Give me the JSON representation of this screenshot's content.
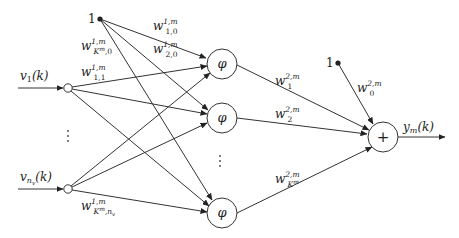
{
  "diagram": {
    "type": "neural-network",
    "inputs": [
      {
        "id": "v1",
        "label": "v",
        "sub": "1",
        "arg": "(k)"
      },
      {
        "id": "vnv",
        "label": "v",
        "sub": "n",
        "subsub": "v",
        "arg": "(k)"
      }
    ],
    "bias_inputs": [
      {
        "id": "bias1",
        "label": "1"
      },
      {
        "id": "bias2",
        "label": "1"
      }
    ],
    "hidden_nodes": [
      {
        "id": "phi1",
        "symbol": "φ"
      },
      {
        "id": "phi2",
        "symbol": "φ"
      },
      {
        "id": "phiK",
        "symbol": "φ"
      }
    ],
    "output_node": {
      "id": "sum",
      "symbol": "+"
    },
    "output_label": {
      "main": "y",
      "sub": "m",
      "arg": "(k)"
    },
    "ellipsis": "⋮",
    "weights": {
      "w1_10": {
        "base": "w",
        "sup": "1,m",
        "sub": "1,0"
      },
      "w1_20": {
        "base": "w",
        "sup": "1,m",
        "sub": "2,0"
      },
      "w1_K0": {
        "base": "w",
        "sup": "1,m",
        "sub_main": "K",
        "sub_sup": "m",
        "sub_tail": ",0"
      },
      "w1_11": {
        "base": "w",
        "sup": "1,m",
        "sub": "1,1"
      },
      "w1_Knv": {
        "base": "w",
        "sup": "1,m",
        "sub_main": "K",
        "sub_sup": "m",
        "sub_tail": ",n",
        "sub_tail_sub": "v"
      },
      "w2_1": {
        "base": "w",
        "sup": "2,m",
        "sub": "1"
      },
      "w2_2": {
        "base": "w",
        "sup": "2,m",
        "sub": "2"
      },
      "w2_K": {
        "base": "w",
        "sup": "2,m",
        "sub_main": "K",
        "sub_sup": "m"
      },
      "w2_0": {
        "base": "w",
        "sup": "2,m",
        "sub": "0"
      }
    }
  }
}
